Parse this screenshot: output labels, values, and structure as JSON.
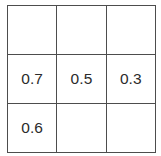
{
  "table": {
    "name": "value-grid",
    "rows": 3,
    "columns": 3,
    "border_color": "#4d4d4d",
    "background_color": "#ffffff",
    "text_color": "#2b2b2b",
    "cells": [
      [
        {
          "value": "",
          "empty": true
        },
        {
          "value": "",
          "empty": true
        },
        {
          "value": "",
          "empty": true
        }
      ],
      [
        {
          "value": "0.7",
          "empty": false
        },
        {
          "value": "0.5",
          "empty": false
        },
        {
          "value": "0.3",
          "empty": false
        }
      ],
      [
        {
          "value": "0.6",
          "empty": false
        },
        {
          "value": "",
          "empty": true
        },
        {
          "value": "",
          "empty": true
        }
      ]
    ]
  }
}
